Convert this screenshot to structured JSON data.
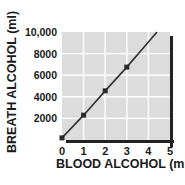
{
  "chart_data": {
    "type": "line",
    "title": "",
    "xlabel": "BLOOD ALCOHOL (ml)",
    "ylabel": "BREATH ALCOHOL (ml)",
    "x_ticks": [
      "0",
      "1",
      "2",
      "3",
      "4",
      "5"
    ],
    "y_ticks": [
      "2000",
      "4000",
      "6000",
      "8000",
      "10,000"
    ],
    "xlim": [
      0,
      5
    ],
    "ylim": [
      0,
      10000
    ],
    "grid": true,
    "legend": null,
    "series": [
      {
        "name": "Breath vs Blood Alcohol",
        "markers": true,
        "points": [
          {
            "x": 0,
            "y": 200
          },
          {
            "x": 1,
            "y": 2300
          },
          {
            "x": 2,
            "y": 4550
          },
          {
            "x": 3,
            "y": 6750
          }
        ],
        "line_extends_to": {
          "x": 4.4,
          "y": 10000
        }
      }
    ],
    "colors": {
      "plot_background": "#dcdcdc",
      "grid": "#ffffff",
      "line": "#333333",
      "marker": "#2a2a2a",
      "shadow": "#222222"
    }
  }
}
